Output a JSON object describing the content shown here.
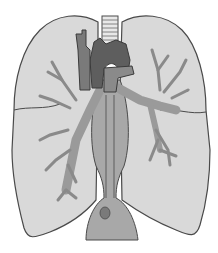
{
  "figure": {
    "colors": {
      "background": "#ffffff",
      "lung_fill": "#d9d9d9",
      "outline": "#4a4a4a",
      "bronchi": "#9a9a9a",
      "aorta_dark": "#5e5e5e",
      "vessel_mid": "#7a7a7a",
      "esophagus": "#a8a8a8",
      "trachea": "#e8e8e8"
    }
  }
}
